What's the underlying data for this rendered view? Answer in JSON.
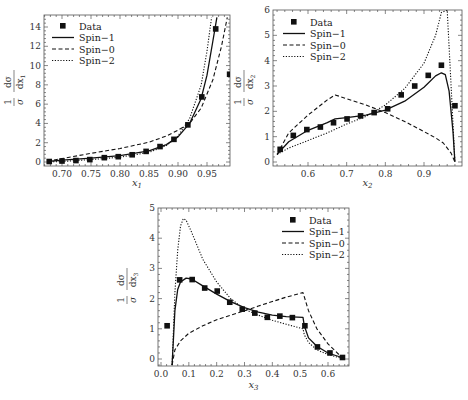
{
  "legend": {
    "data": "Data",
    "spin1": "Spin−1",
    "spin0": "Spin−0",
    "spin2": "Spin−2"
  },
  "chart_data": [
    {
      "type": "line",
      "title": "",
      "xlabel": "x1",
      "ylabel": "1/σ dσ/dx1",
      "xlim": [
        0.675,
        0.99
      ],
      "ylim": [
        0,
        15
      ],
      "x_ticks": [
        "0.70",
        "0.75",
        "0.80",
        "0.85",
        "0.90",
        "0.95"
      ],
      "y_ticks": [
        "0",
        "2",
        "4",
        "6",
        "8",
        "10",
        "12",
        "14"
      ],
      "legend_position": "upper left",
      "series": [
        {
          "name": "Data",
          "style": "markers",
          "x": [
            0.678,
            0.7,
            0.724,
            0.748,
            0.773,
            0.797,
            0.821,
            0.845,
            0.869,
            0.893,
            0.917,
            0.941,
            0.965,
            0.989
          ],
          "y": [
            0.05,
            0.1,
            0.15,
            0.25,
            0.45,
            0.55,
            0.75,
            1.1,
            1.6,
            2.35,
            3.85,
            6.75,
            13.8,
            9.1
          ]
        },
        {
          "name": "Spin-1",
          "style": "solid",
          "x": [
            0.675,
            0.7,
            0.75,
            0.8,
            0.85,
            0.88,
            0.9,
            0.92,
            0.94,
            0.95,
            0.96,
            0.967
          ],
          "y": [
            0.05,
            0.2,
            0.4,
            0.65,
            1.15,
            1.8,
            2.6,
            4.0,
            6.6,
            9.0,
            12.5,
            15
          ]
        },
        {
          "name": "Spin-0",
          "style": "dashed",
          "x": [
            0.675,
            0.7,
            0.75,
            0.8,
            0.85,
            0.88,
            0.9,
            0.92,
            0.94,
            0.96,
            0.975,
            0.985
          ],
          "y": [
            0.1,
            0.35,
            0.9,
            1.4,
            2.05,
            2.7,
            3.3,
            4.0,
            5.6,
            8.5,
            12.0,
            15
          ]
        },
        {
          "name": "Spin-2",
          "style": "dotted",
          "x": [
            0.675,
            0.7,
            0.75,
            0.8,
            0.85,
            0.88,
            0.9,
            0.92,
            0.94,
            0.95,
            0.958
          ],
          "y": [
            0.0,
            0.05,
            0.25,
            0.5,
            1.0,
            1.7,
            2.7,
            4.5,
            8.0,
            11.5,
            15
          ]
        }
      ]
    },
    {
      "type": "line",
      "title": "",
      "xlabel": "x2",
      "ylabel": "1/σ dσ/dx2",
      "xlim": [
        0.52,
        0.99
      ],
      "ylim": [
        0,
        6
      ],
      "x_ticks": [
        "0.6",
        "0.7",
        "0.8",
        "0.9"
      ],
      "y_ticks": [
        "0",
        "1",
        "2",
        "3",
        "4",
        "5",
        "6"
      ],
      "legend_position": "upper left",
      "series": [
        {
          "name": "Data",
          "style": "markers",
          "x": [
            0.528,
            0.562,
            0.597,
            0.632,
            0.666,
            0.701,
            0.736,
            0.771,
            0.806,
            0.841,
            0.876,
            0.911,
            0.945,
            0.98
          ],
          "y": [
            0.5,
            1.05,
            1.28,
            1.38,
            1.55,
            1.7,
            1.82,
            1.95,
            2.1,
            2.65,
            3.0,
            3.42,
            3.82,
            2.22
          ]
        },
        {
          "name": "Spin-1",
          "style": "solid",
          "x": [
            0.52,
            0.55,
            0.6,
            0.65,
            0.67,
            0.7,
            0.75,
            0.8,
            0.85,
            0.9,
            0.93,
            0.945,
            0.955,
            0.965,
            0.975,
            0.98
          ],
          "y": [
            0.3,
            0.8,
            1.25,
            1.55,
            1.7,
            1.75,
            1.85,
            2.05,
            2.4,
            2.95,
            3.4,
            3.52,
            3.45,
            2.8,
            1.2,
            0.0
          ]
        },
        {
          "name": "Spin-0",
          "style": "dashed",
          "x": [
            0.52,
            0.55,
            0.6,
            0.65,
            0.67,
            0.7,
            0.75,
            0.8,
            0.85,
            0.9,
            0.93,
            0.95,
            0.97,
            0.98
          ],
          "y": [
            0.3,
            1.15,
            1.85,
            2.45,
            2.65,
            2.5,
            2.25,
            1.95,
            1.6,
            1.2,
            0.95,
            0.75,
            0.35,
            0.0
          ]
        },
        {
          "name": "Spin-2",
          "style": "dotted",
          "x": [
            0.52,
            0.55,
            0.6,
            0.65,
            0.7,
            0.75,
            0.8,
            0.85,
            0.9,
            0.93,
            0.945,
            0.96,
            0.97,
            0.98
          ],
          "y": [
            0.3,
            0.55,
            0.85,
            1.15,
            1.5,
            1.8,
            2.25,
            2.9,
            3.9,
            5.0,
            5.9,
            6.0,
            3.0,
            0.0
          ]
        }
      ]
    },
    {
      "type": "line",
      "title": "",
      "xlabel": "x3",
      "ylabel": "1/σ dσ/dx3",
      "xlim": [
        -0.01,
        0.67
      ],
      "ylim": [
        -0.2,
        5
      ],
      "x_ticks": [
        "0.0",
        "0.1",
        "0.2",
        "0.3",
        "0.4",
        "0.5",
        "0.6"
      ],
      "y_ticks": [
        "0",
        "1",
        "2",
        "3",
        "4",
        "5"
      ],
      "legend_position": "upper right",
      "series": [
        {
          "name": "Data",
          "style": "markers",
          "x": [
            0.022,
            0.067,
            0.112,
            0.157,
            0.202,
            0.247,
            0.292,
            0.337,
            0.382,
            0.427,
            0.472,
            0.517,
            0.562,
            0.607,
            0.652
          ],
          "y": [
            1.1,
            2.62,
            2.63,
            2.35,
            2.25,
            1.88,
            1.65,
            1.52,
            1.38,
            1.42,
            1.37,
            1.1,
            0.4,
            0.2,
            0.05
          ]
        },
        {
          "name": "Spin-1",
          "style": "solid",
          "x": [
            0.04,
            0.05,
            0.06,
            0.07,
            0.09,
            0.11,
            0.15,
            0.2,
            0.25,
            0.3,
            0.35,
            0.4,
            0.45,
            0.51,
            0.515,
            0.53,
            0.56,
            0.6,
            0.65
          ],
          "y": [
            -0.2,
            1.6,
            2.3,
            2.55,
            2.68,
            2.65,
            2.42,
            2.15,
            1.9,
            1.7,
            1.55,
            1.45,
            1.4,
            1.38,
            1.1,
            0.7,
            0.42,
            0.2,
            0.05
          ]
        },
        {
          "name": "Spin-0",
          "style": "dashed",
          "x": [
            0.04,
            0.05,
            0.07,
            0.1,
            0.15,
            0.2,
            0.25,
            0.3,
            0.35,
            0.4,
            0.45,
            0.51,
            0.53,
            0.56,
            0.6,
            0.65
          ],
          "y": [
            -0.2,
            0.3,
            0.6,
            0.85,
            1.1,
            1.3,
            1.45,
            1.6,
            1.75,
            1.9,
            2.05,
            2.2,
            1.6,
            1.0,
            0.5,
            0.05
          ]
        },
        {
          "name": "Spin-2",
          "style": "dotted",
          "x": [
            0.04,
            0.05,
            0.06,
            0.07,
            0.08,
            0.09,
            0.11,
            0.15,
            0.2,
            0.25,
            0.3,
            0.35,
            0.4,
            0.45,
            0.51,
            0.515,
            0.53,
            0.56,
            0.6,
            0.65
          ],
          "y": [
            -0.2,
            2.2,
            3.6,
            4.4,
            4.65,
            4.6,
            4.2,
            3.3,
            2.55,
            2.0,
            1.65,
            1.45,
            1.28,
            1.15,
            1.0,
            0.8,
            0.55,
            0.3,
            0.15,
            0.02
          ]
        }
      ]
    }
  ]
}
